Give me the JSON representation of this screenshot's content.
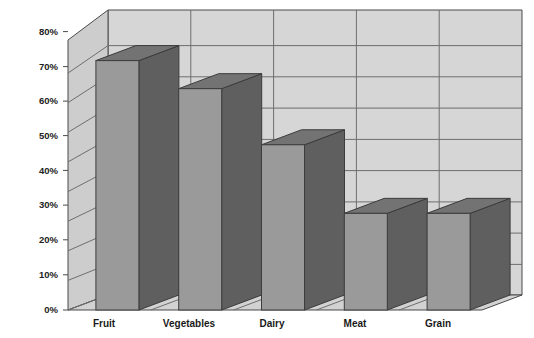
{
  "chart_data": {
    "type": "bar",
    "title": "",
    "subtitle": "",
    "xlabel": "",
    "ylabel": "",
    "categories": [
      "Fruit",
      "Vegetables",
      "Dairy",
      "Meat",
      "Grain"
    ],
    "values": [
      80,
      71,
      53,
      31,
      31
    ],
    "value_suffix": "%",
    "ylim": [
      0,
      80
    ],
    "ytick_values": [
      0,
      10,
      20,
      30,
      40,
      50,
      60,
      70,
      80
    ],
    "ytick_labels": [
      "0%",
      "10%",
      "20%",
      "30%",
      "40%",
      "50%",
      "60%",
      "70%",
      "80%"
    ],
    "grid": true,
    "grid_axis": "y",
    "legend": false,
    "legend_position": "none",
    "style": "3d-column",
    "series": [
      {
        "name": "Series 1",
        "values": [
          80,
          71,
          53,
          31,
          31
        ]
      }
    ],
    "annotations": []
  },
  "colors": {
    "bar_front": "#9a9a9a",
    "bar_side": "#5f5f5f",
    "bar_top": "#737373",
    "bar_outline": "#3c3c3c",
    "wall_back": "#d6d6d6",
    "wall_side": "#cfcfcf",
    "floor": "#d2d2d2",
    "gridline": "#6e6e6e",
    "frame": "#4a4a4a",
    "background": "#ffffff",
    "tick_label": "#222222",
    "category_label": "#1a1a1a"
  },
  "axes": {
    "y_axis_name": "percentage-axis",
    "x_axis_name": "category-axis"
  }
}
